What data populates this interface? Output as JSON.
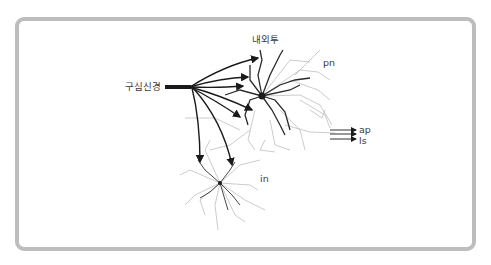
{
  "figure": {
    "labels": {
      "afferent": "구심신경",
      "top": "내외투",
      "projection": "pn",
      "interneuron": "in",
      "output_1": "ap",
      "output_2": "ls"
    },
    "colors": {
      "frame": "#bdbdbd",
      "arrows": "#1a1a1a",
      "dendrites": "#555555",
      "fine_dendrites": "#9a9a9a",
      "text": "#3a3a3a"
    }
  }
}
